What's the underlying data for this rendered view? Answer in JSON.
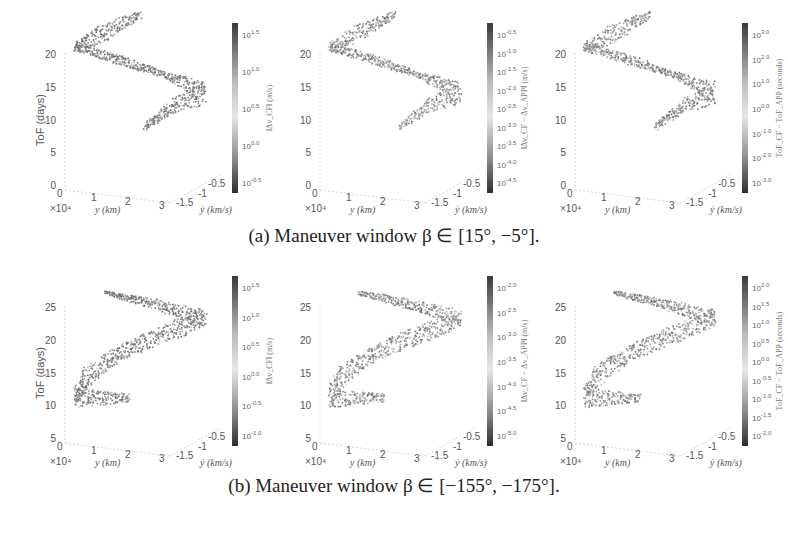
{
  "figure": {
    "caption_a": "(a) Maneuver window β ∈ [15°, −5°].",
    "caption_b": "(b) Maneuver window β ∈ [−155°, −175°]."
  },
  "axes_common": {
    "zlabel": "ToF (days)",
    "xlabel": "y (km)",
    "ylabel": "ẏ (km/s)",
    "x_ticks": [
      "0",
      "1",
      "2",
      "3"
    ],
    "x_multiplier": "×10⁴",
    "y_ticks": [
      "-1.5",
      "-1",
      "-0.5"
    ]
  },
  "row_a": {
    "z_ticks": [
      "0",
      "5",
      "10",
      "15",
      "20"
    ],
    "panels": [
      {
        "cbar_label": "‖Δv_CF‖ (m/s)",
        "cbar_ticks": [
          "10^1.5",
          "10^1.0",
          "10^0.5",
          "10^0.0",
          "10^-0.5"
        ]
      },
      {
        "cbar_label": "‖Δv_CF − Δv_APP‖ (m/s)",
        "cbar_ticks": [
          "10^-0.5",
          "10^-1.0",
          "10^-1.5",
          "10^-2.0",
          "10^-2.5",
          "10^-3.0",
          "10^-3.5",
          "10^-4.0",
          "10^-4.5"
        ]
      },
      {
        "cbar_label": "ToF_CF − ToF_APP (seconds)",
        "cbar_ticks": [
          "10^3.0",
          "10^2.0",
          "10^1.0",
          "10^0.0",
          "10^-1.0",
          "10^-2.0",
          "10^-3.0"
        ]
      }
    ]
  },
  "row_b": {
    "z_ticks": [
      "5",
      "10",
      "15",
      "20",
      "25"
    ],
    "panels": [
      {
        "cbar_label": "‖Δv_CF‖ (m/s)",
        "cbar_ticks": [
          "10^1.5",
          "10^1.0",
          "10^0.5",
          "10^0.0",
          "10^-0.5",
          "10^-1.0"
        ]
      },
      {
        "cbar_label": "‖Δv_CF − Δv_APP‖ (m/s)",
        "cbar_ticks": [
          "10^-2.0",
          "10^-2.5",
          "10^-3.0",
          "10^-3.5",
          "10^-4.0",
          "10^-4.5",
          "10^-5.0"
        ]
      },
      {
        "cbar_label": "ToF_CF − ToF_APP (seconds)",
        "cbar_ticks": [
          "10^2.0",
          "10^1.5",
          "10^1.0",
          "10^0.5",
          "10^0.0",
          "10^-0.5",
          "10^-1.0",
          "10^-1.5",
          "10^-2.0"
        ]
      }
    ]
  },
  "chart_data": [
    {
      "type": "scatter",
      "panel": "a1",
      "title": "",
      "xlabel": "y (km)",
      "ylabel": "ẏ (km/s)",
      "zlabel": "ToF (days)",
      "xlim": [
        0,
        30000
      ],
      "ylim": [
        -1.5,
        -0.5
      ],
      "zlim": [
        0,
        22
      ],
      "color_scale": "log",
      "colorbar_label": "‖Δv_CF‖ (m/s)",
      "colorbar_range": [
        "10^-0.5",
        "10^1.5"
      ],
      "shape": "Z-shaped band from ToF≈8 to ToF≈22 days"
    },
    {
      "type": "scatter",
      "panel": "a2",
      "xlabel": "y (km)",
      "ylabel": "ẏ (km/s)",
      "zlabel": "ToF (days)",
      "xlim": [
        0,
        30000
      ],
      "ylim": [
        -1.5,
        -0.5
      ],
      "zlim": [
        0,
        22
      ],
      "color_scale": "log",
      "colorbar_label": "‖Δv_CF − Δv_APP‖ (m/s)",
      "colorbar_range": [
        "10^-4.5",
        "10^-0.5"
      ]
    },
    {
      "type": "scatter",
      "panel": "a3",
      "xlabel": "y (km)",
      "ylabel": "ẏ (km/s)",
      "zlabel": "ToF (days)",
      "xlim": [
        0,
        30000
      ],
      "ylim": [
        -1.5,
        -0.5
      ],
      "zlim": [
        0,
        22
      ],
      "color_scale": "log",
      "colorbar_label": "ToF_CF − ToF_APP (seconds)",
      "colorbar_range": [
        "10^-3.0",
        "10^3.0"
      ]
    },
    {
      "type": "scatter",
      "panel": "b1",
      "xlabel": "y (km)",
      "ylabel": "ẏ (km/s)",
      "zlabel": "ToF (days)",
      "xlim": [
        0,
        30000
      ],
      "ylim": [
        -1.5,
        -0.5
      ],
      "zlim": [
        5,
        25
      ],
      "color_scale": "log",
      "colorbar_label": "‖Δv_CF‖ (m/s)",
      "colorbar_range": [
        "10^-1.0",
        "10^1.5"
      ],
      "shape": "chevron band from ToF≈9 to ToF≈24 days"
    },
    {
      "type": "scatter",
      "panel": "b2",
      "xlabel": "y (km)",
      "ylabel": "ẏ (km/s)",
      "zlabel": "ToF (days)",
      "xlim": [
        0,
        30000
      ],
      "ylim": [
        -1.5,
        -0.5
      ],
      "zlim": [
        5,
        25
      ],
      "color_scale": "log",
      "colorbar_label": "‖Δv_CF − Δv_APP‖ (m/s)",
      "colorbar_range": [
        "10^-5.0",
        "10^-2.0"
      ]
    },
    {
      "type": "scatter",
      "panel": "b3",
      "xlabel": "y (km)",
      "ylabel": "ẏ (km/s)",
      "zlabel": "ToF (days)",
      "xlim": [
        0,
        30000
      ],
      "ylim": [
        -1.5,
        -0.5
      ],
      "zlim": [
        5,
        25
      ],
      "color_scale": "log",
      "colorbar_label": "ToF_CF − ToF_APP (seconds)",
      "colorbar_range": [
        "10^-2.0",
        "10^2.0"
      ]
    }
  ]
}
